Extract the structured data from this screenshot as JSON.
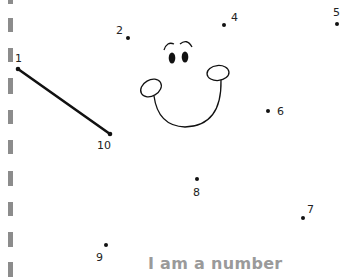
{
  "worksheet": {
    "title": "I am a number",
    "caption_color": "#9a9a9a",
    "ink_color": "#111111",
    "margin_dash_color": "#8c8c8c",
    "dots": [
      {
        "label": "1",
        "x": 18,
        "y": 69,
        "lx": 15,
        "ly": 53
      },
      {
        "label": "2",
        "x": 128,
        "y": 38,
        "lx": 116,
        "ly": 25
      },
      {
        "label": "4",
        "x": 224,
        "y": 25,
        "lx": 231,
        "ly": 12
      },
      {
        "label": "5",
        "x": 337,
        "y": 24,
        "lx": 333,
        "ly": 7
      },
      {
        "label": "6",
        "x": 268,
        "y": 111,
        "lx": 277,
        "ly": 106
      },
      {
        "label": "7",
        "x": 303,
        "y": 218,
        "lx": 307,
        "ly": 204
      },
      {
        "label": "8",
        "x": 197,
        "y": 179,
        "lx": 193,
        "ly": 187
      },
      {
        "label": "9",
        "x": 106,
        "y": 245,
        "lx": 96,
        "ly": 252
      },
      {
        "label": "10",
        "x": 110,
        "y": 134,
        "lx": 97,
        "ly": 140
      }
    ],
    "connected_segment": {
      "from": "1",
      "to": "10"
    }
  }
}
